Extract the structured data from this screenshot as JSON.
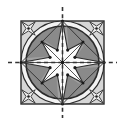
{
  "figure": {
    "type": "geometric-construction",
    "canvas": {
      "width": 125,
      "height": 125,
      "background": "#ffffff"
    },
    "colors": {
      "background": "#ffffff",
      "square_fill": "#d6d6d6",
      "ring_band": "#f2f2f2",
      "circle_fill": "#8a8a8a",
      "star_fill": "#fbfbfb",
      "star_shadow": "#b2b2b2",
      "outline": "#2b2b2b",
      "axis_line": "#333333"
    },
    "square": {
      "label": "bounding-square",
      "x": 21,
      "y": 21,
      "width": 83,
      "height": 83,
      "fill": "#d6d6d6",
      "stroke": "#2b2b2b",
      "stroke_width": 1.4
    },
    "outer_circle": {
      "label": "inscribed-circle-outer",
      "cx": 62.5,
      "cy": 62.5,
      "r": 41.5,
      "fill": "#f2f2f2",
      "stroke": "#2b2b2b",
      "stroke_width": 1.2
    },
    "inner_circle": {
      "label": "inner-disc",
      "cx": 62.5,
      "cy": 62.5,
      "r": 36.5,
      "fill": "#8a8a8a",
      "stroke": "#2b2b2b",
      "stroke_width": 1.6
    },
    "star": {
      "label": "eight-point-star",
      "points": 8,
      "cx": 62.5,
      "cy": 62.5,
      "outer_radius_cardinal": 41.5,
      "outer_radius_diagonal": 29.0,
      "inner_radius": 13.5,
      "fill": "#fbfbfb",
      "stroke": "#2b2b2b",
      "stroke_width": 1.1,
      "tip_angles_deg": [
        0,
        45,
        90,
        135,
        180,
        225,
        270,
        315
      ]
    },
    "corner_stars": {
      "label": "corner-x-stars",
      "count": 4,
      "radius": 9.5,
      "centers": [
        {
          "cx": 28.5,
          "cy": 28.5
        },
        {
          "cx": 96.5,
          "cy": 28.5
        },
        {
          "cx": 28.5,
          "cy": 96.5
        },
        {
          "cx": 96.5,
          "cy": 96.5
        }
      ],
      "fill": "#efefef",
      "stroke": "#2b2b2b"
    },
    "axes": [
      {
        "name": "horizontal-axis",
        "orientation": "horizontal",
        "x1": 8,
        "y1": 62.5,
        "x2": 117,
        "y2": 62.5,
        "dash": "4,3.2",
        "stroke": "#333333",
        "stroke_width": 1.6
      },
      {
        "name": "vertical-axis",
        "orientation": "vertical",
        "x1": 62.5,
        "y1": 7,
        "x2": 62.5,
        "y2": 118,
        "dash": "4,3.2",
        "stroke": "#333333",
        "stroke_width": 1.6
      }
    ],
    "center_point": {
      "cx": 62.5,
      "cy": 62.5,
      "r": 1.8,
      "fill": "#1a1a1a"
    },
    "vertex_dots": {
      "label": "star-inner-vertex-dots",
      "r": 1.6,
      "fill": "#1a1a1a",
      "angles_deg": [
        22.5,
        67.5,
        112.5,
        157.5,
        202.5,
        247.5,
        292.5,
        337.5
      ],
      "radius": 13.5
    }
  }
}
